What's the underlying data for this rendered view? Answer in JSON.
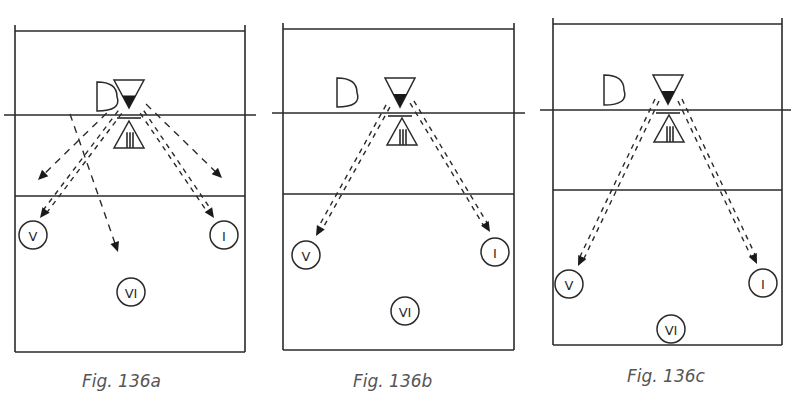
{
  "colors": {
    "ink": "#2a2a2a",
    "caption": "#555555",
    "background": "#ffffff"
  },
  "figures": [
    {
      "id": "fig-136a",
      "caption": "Fig. 136a",
      "caption_pos": [
        82,
        371
      ],
      "court": {
        "left": 15,
        "right": 245,
        "top": 31,
        "bottom": 352,
        "net_y": 115,
        "attack_y": 196,
        "net_x1": 4,
        "net_x2": 256
      },
      "setter_d": {
        "x": 97,
        "y": 82,
        "w": 20,
        "h": 29
      },
      "blocker_top": {
        "cx": 129,
        "top": 80,
        "w": 30,
        "h": 28
      },
      "block_bar": {
        "y": 118,
        "w": 24
      },
      "blocker_bottom": {
        "cx": 129,
        "top": 121,
        "w": 30,
        "h": 27
      },
      "players": [
        {
          "label": "V",
          "cx": 33,
          "cy": 235,
          "r": 14
        },
        {
          "label": "I",
          "cx": 224,
          "cy": 235,
          "r": 14
        },
        {
          "label": "VI",
          "cx": 131,
          "cy": 292,
          "r": 14
        }
      ],
      "paths": [
        {
          "type": "double",
          "from": [
            120,
            112
          ],
          "to": [
            40,
            218
          ]
        },
        {
          "type": "double",
          "from": [
            142,
            112
          ],
          "to": [
            214,
            218
          ]
        },
        {
          "type": "single",
          "from": [
            116,
            104
          ],
          "to": [
            38,
            180
          ]
        },
        {
          "type": "single",
          "from": [
            146,
            104
          ],
          "to": [
            222,
            178
          ]
        },
        {
          "type": "single",
          "from": [
            70,
            114
          ],
          "to": [
            118,
            252
          ]
        }
      ]
    },
    {
      "id": "fig-136b",
      "caption": "Fig. 136b",
      "caption_pos": [
        353,
        371
      ],
      "court": {
        "left": 283,
        "right": 514,
        "top": 29,
        "bottom": 350,
        "net_y": 113,
        "attack_y": 194,
        "net_x1": 272,
        "net_x2": 525
      },
      "setter_d": {
        "x": 337,
        "y": 78,
        "w": 20,
        "h": 29
      },
      "blocker_top": {
        "cx": 400,
        "top": 78,
        "w": 30,
        "h": 29
      },
      "block_bar": {
        "y": 116,
        "w": 24
      },
      "blocker_bottom": {
        "cx": 402,
        "top": 118,
        "w": 30,
        "h": 27
      },
      "players": [
        {
          "label": "V",
          "cx": 306,
          "cy": 255,
          "r": 14
        },
        {
          "label": "I",
          "cx": 495,
          "cy": 252,
          "r": 14
        },
        {
          "label": "VI",
          "cx": 405,
          "cy": 311,
          "r": 14
        }
      ],
      "paths": [
        {
          "type": "double",
          "from": [
            388,
            106
          ],
          "to": [
            316,
            236
          ]
        },
        {
          "type": "double",
          "from": [
            412,
            102
          ],
          "to": [
            490,
            232
          ]
        }
      ]
    },
    {
      "id": "fig-136c",
      "caption": "Fig. 136c",
      "caption_pos": [
        627,
        366
      ],
      "court": {
        "left": 553,
        "right": 782,
        "top": 24,
        "bottom": 345,
        "net_y": 110,
        "attack_y": 190,
        "net_x1": 540,
        "net_x2": 791
      },
      "setter_d": {
        "x": 604,
        "y": 75,
        "w": 20,
        "h": 30
      },
      "blocker_top": {
        "cx": 668,
        "top": 75,
        "w": 30,
        "h": 29
      },
      "block_bar": {
        "y": 113,
        "w": 24
      },
      "blocker_bottom": {
        "cx": 669,
        "top": 115,
        "w": 30,
        "h": 27
      },
      "players": [
        {
          "label": "V",
          "cx": 569,
          "cy": 284,
          "r": 14
        },
        {
          "label": "I",
          "cx": 763,
          "cy": 283,
          "r": 14
        },
        {
          "label": "VI",
          "cx": 671,
          "cy": 329,
          "r": 14
        }
      ],
      "paths": [
        {
          "type": "double",
          "from": [
            657,
            100
          ],
          "to": [
            578,
            266
          ]
        },
        {
          "type": "double",
          "from": [
            680,
            100
          ],
          "to": [
            757,
            264
          ]
        }
      ]
    }
  ]
}
